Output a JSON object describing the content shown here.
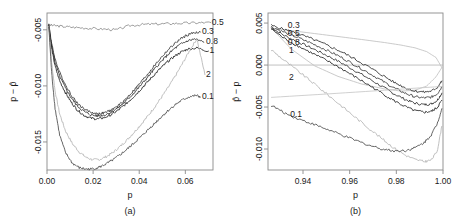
{
  "figure": {
    "background": "#ffffff",
    "frame_color": "#8a8a8a"
  },
  "chart_data": [
    {
      "type": "line",
      "panel": "a",
      "panel_label": "(a)",
      "title": "",
      "xlabel": "p",
      "ylabel": "p − p̂",
      "xlim": [
        0.0,
        0.072
      ],
      "ylim": [
        -0.0175,
        -0.0035
      ],
      "xticks": [
        0.0,
        0.02,
        0.04,
        0.06
      ],
      "xtick_labels": [
        "0.00",
        "0.02",
        "0.04",
        "0.06"
      ],
      "yticks": [
        -0.005,
        -0.01,
        -0.015
      ],
      "ytick_labels": [
        "-0.005",
        "-0.010",
        "-0.015"
      ],
      "grid": false,
      "legend": "inline-curve-labels-right",
      "series": [
        {
          "name": "0.5",
          "label": "0.5",
          "color": "#8c8c8c",
          "label_x": 0.0715,
          "label_y": -0.00435,
          "x": [
            0.0005,
            0.003,
            0.007,
            0.012,
            0.018,
            0.024,
            0.03,
            0.036,
            0.042,
            0.048,
            0.054,
            0.06,
            0.066,
            0.071
          ],
          "y": [
            -0.00455,
            -0.00462,
            -0.0047,
            -0.00478,
            -0.00486,
            -0.00493,
            -0.005,
            -0.00462,
            -0.00452,
            -0.00448,
            -0.00444,
            -0.0044,
            -0.00437,
            -0.00435
          ]
        },
        {
          "name": "0.3",
          "label": "0.3",
          "color": "#3a3a3a",
          "label_x": 0.0672,
          "label_y": -0.0052,
          "x": [
            0.0008,
            0.002,
            0.0035,
            0.0055,
            0.008,
            0.0105,
            0.013,
            0.016,
            0.019,
            0.022,
            0.025,
            0.028,
            0.031,
            0.034,
            0.037,
            0.04,
            0.043,
            0.046,
            0.049,
            0.052,
            0.055,
            0.058,
            0.061,
            0.064,
            0.0665
          ],
          "y": [
            -0.00455,
            -0.0062,
            -0.0076,
            -0.0088,
            -0.0099,
            -0.0108,
            -0.0115,
            -0.01205,
            -0.01235,
            -0.0125,
            -0.0124,
            -0.01215,
            -0.01175,
            -0.0112,
            -0.01055,
            -0.00985,
            -0.0091,
            -0.00835,
            -0.0076,
            -0.0069,
            -0.0063,
            -0.0058,
            -0.00545,
            -0.00525,
            -0.0052
          ]
        },
        {
          "name": "0.8",
          "label": "0.8",
          "color": "#2a2a2a",
          "label_x": 0.069,
          "label_y": -0.0061,
          "x": [
            0.0008,
            0.002,
            0.0035,
            0.0055,
            0.008,
            0.0105,
            0.013,
            0.016,
            0.019,
            0.022,
            0.025,
            0.028,
            0.031,
            0.034,
            0.037,
            0.04,
            0.043,
            0.046,
            0.049,
            0.052,
            0.055,
            0.058,
            0.061,
            0.064,
            0.068
          ],
          "y": [
            -0.0046,
            -0.0064,
            -0.0079,
            -0.00915,
            -0.0102,
            -0.01105,
            -0.01175,
            -0.01228,
            -0.01258,
            -0.01268,
            -0.01258,
            -0.01232,
            -0.01192,
            -0.0114,
            -0.01078,
            -0.0101,
            -0.00938,
            -0.00865,
            -0.00795,
            -0.0073,
            -0.00672,
            -0.00628,
            -0.00598,
            -0.00582,
            -0.0061
          ]
        },
        {
          "name": "1",
          "label": "1",
          "color": "#1f1f1f",
          "label_x": 0.0705,
          "label_y": -0.0069,
          "x": [
            0.0008,
            0.002,
            0.0035,
            0.0055,
            0.008,
            0.0105,
            0.013,
            0.016,
            0.019,
            0.022,
            0.025,
            0.028,
            0.031,
            0.034,
            0.037,
            0.04,
            0.043,
            0.046,
            0.049,
            0.052,
            0.055,
            0.058,
            0.061,
            0.065,
            0.07
          ],
          "y": [
            -0.00465,
            -0.00665,
            -0.00825,
            -0.00955,
            -0.0106,
            -0.01145,
            -0.01212,
            -0.01262,
            -0.01288,
            -0.01295,
            -0.01282,
            -0.01255,
            -0.01215,
            -0.01165,
            -0.01108,
            -0.01045,
            -0.00978,
            -0.00912,
            -0.00848,
            -0.0079,
            -0.0074,
            -0.007,
            -0.00672,
            -0.00662,
            -0.0069
          ]
        },
        {
          "name": "2",
          "label": "2",
          "color": "#b5b5b5",
          "label_x": 0.069,
          "label_y": -0.009,
          "x": [
            0.0008,
            0.002,
            0.0035,
            0.0055,
            0.008,
            0.011,
            0.014,
            0.017,
            0.02,
            0.023,
            0.026,
            0.029,
            0.032,
            0.035,
            0.038,
            0.041,
            0.044,
            0.047,
            0.05,
            0.053,
            0.056,
            0.059,
            0.062,
            0.065,
            0.0685
          ],
          "y": [
            -0.0047,
            -0.0079,
            -0.01045,
            -0.0125,
            -0.014,
            -0.01515,
            -0.0159,
            -0.01638,
            -0.0166,
            -0.01655,
            -0.01628,
            -0.01588,
            -0.01535,
            -0.01475,
            -0.01408,
            -0.01338,
            -0.01262,
            -0.0118,
            -0.01092,
            -0.01,
            -0.009,
            -0.00792,
            -0.0068,
            -0.0058,
            -0.009
          ]
        },
        {
          "name": "0.1",
          "label": "0.1",
          "color": "#4a4a4a",
          "label_x": 0.0672,
          "label_y": -0.011,
          "x": [
            0.0008,
            0.002,
            0.0035,
            0.0055,
            0.008,
            0.011,
            0.014,
            0.017,
            0.02,
            0.023,
            0.026,
            0.029,
            0.032,
            0.035,
            0.038,
            0.041,
            0.044,
            0.047,
            0.05,
            0.053,
            0.056,
            0.059,
            0.062,
            0.065,
            0.0665
          ],
          "y": [
            -0.00475,
            -0.0088,
            -0.012,
            -0.0144,
            -0.01595,
            -0.0169,
            -0.0173,
            -0.01742,
            -0.0174,
            -0.01722,
            -0.01692,
            -0.01655,
            -0.0161,
            -0.0156,
            -0.01505,
            -0.01448,
            -0.01388,
            -0.01328,
            -0.01268,
            -0.01212,
            -0.01162,
            -0.01122,
            -0.01095,
            -0.01085,
            -0.011
          ]
        }
      ]
    },
    {
      "type": "line",
      "panel": "b",
      "panel_label": "(b)",
      "title": "",
      "xlabel": "p",
      "ylabel": "p̂ − p",
      "xlim": [
        0.925,
        1.0
      ],
      "ylim": [
        -0.0125,
        0.0062
      ],
      "xticks": [
        0.94,
        0.96,
        0.98,
        1.0
      ],
      "xtick_labels": [
        "0.94",
        "0.96",
        "0.98",
        "1.00"
      ],
      "yticks": [
        0.005,
        0.0,
        -0.005,
        -0.01
      ],
      "ytick_labels": [
        "0.005",
        "0.000",
        "-0.005",
        "-0.010"
      ],
      "grid": false,
      "zero_line": 0.0,
      "legend": "inline-curve-labels-left",
      "series": [
        {
          "name": "0.5-envelope",
          "label": "",
          "color": "#c0c0c0",
          "label_x": null,
          "label_y": null,
          "x": [
            0.9265,
            0.935,
            0.945,
            0.955,
            0.965,
            0.975,
            0.982,
            0.988,
            0.993,
            0.997,
            0.9995
          ],
          "y": [
            0.0044,
            0.0041,
            0.00375,
            0.0034,
            0.00305,
            0.00268,
            0.00238,
            0.00205,
            0.0016,
            0.0009,
            -0.0003
          ]
        },
        {
          "name": "0.5-envelope-lower",
          "label": "",
          "color": "#c0c0c0",
          "label_x": null,
          "label_y": null,
          "x": [
            0.9265,
            0.935,
            0.945,
            0.955,
            0.965,
            0.975,
            0.982,
            0.988,
            0.993,
            0.997,
            0.9995
          ],
          "y": [
            0.0044,
            0.0019,
            -0.0001,
            -0.00135,
            -0.00225,
            -0.00285,
            -0.0031,
            -0.003,
            -0.0025,
            -0.0014,
            -0.0003
          ]
        },
        {
          "name": "0.3",
          "label": "0.3",
          "color": "#2a2a2a",
          "label_x": 0.9335,
          "label_y": 0.00465,
          "x": [
            0.9265,
            0.932,
            0.938,
            0.944,
            0.95,
            0.956,
            0.962,
            0.968,
            0.974,
            0.979,
            0.984,
            0.988,
            0.992,
            0.995,
            0.9975,
            0.9995
          ],
          "y": [
            0.0047,
            0.00425,
            0.0037,
            0.0031,
            0.0024,
            0.00165,
            0.00075,
            -0.0002,
            -0.0012,
            -0.00205,
            -0.00272,
            -0.0031,
            -0.00322,
            -0.0031,
            -0.00268,
            -0.0019
          ]
        },
        {
          "name": "0.5",
          "label": "0.5",
          "color": "#3a3a3a",
          "label_x": 0.9335,
          "label_y": 0.0037,
          "x": [
            0.9265,
            0.932,
            0.938,
            0.944,
            0.95,
            0.956,
            0.962,
            0.968,
            0.974,
            0.979,
            0.984,
            0.988,
            0.992,
            0.995,
            0.9975,
            0.9995
          ],
          "y": [
            0.00455,
            0.0039,
            0.00325,
            0.00255,
            0.0018,
            0.00098,
            5e-05,
            -0.0009,
            -0.0019,
            -0.00272,
            -0.00338,
            -0.00378,
            -0.00392,
            -0.00382,
            -0.00342,
            -0.00262
          ]
        },
        {
          "name": "0.8",
          "label": "0.8",
          "color": "#2f2f2f",
          "label_x": 0.9335,
          "label_y": 0.00262,
          "x": [
            0.9265,
            0.932,
            0.938,
            0.944,
            0.95,
            0.956,
            0.962,
            0.968,
            0.974,
            0.979,
            0.984,
            0.988,
            0.992,
            0.995,
            0.9975,
            0.9995
          ],
          "y": [
            0.00442,
            0.00352,
            0.00275,
            0.00198,
            0.00118,
            0.00032,
            -0.00062,
            -0.00158,
            -0.00258,
            -0.00342,
            -0.00412,
            -0.00455,
            -0.00472,
            -0.00462,
            -0.0042,
            -0.00335
          ]
        },
        {
          "name": "1",
          "label": "1",
          "color": "#1f1f1f",
          "label_x": 0.934,
          "label_y": 0.00175,
          "x": [
            0.9265,
            0.932,
            0.938,
            0.944,
            0.95,
            0.956,
            0.962,
            0.968,
            0.974,
            0.979,
            0.984,
            0.988,
            0.992,
            0.995,
            0.9975,
            0.9995
          ],
          "y": [
            0.0043,
            0.00315,
            0.00225,
            0.0014,
            0.00055,
            -0.00035,
            -0.00135,
            -0.00235,
            -0.00338,
            -0.00425,
            -0.00498,
            -0.00545,
            -0.00562,
            -0.00552,
            -0.00508,
            -0.0042
          ]
        },
        {
          "name": "2",
          "label": "2",
          "color": "#b5b5b5",
          "label_x": 0.934,
          "label_y": -0.00148,
          "x": [
            0.9265,
            0.932,
            0.938,
            0.944,
            0.95,
            0.956,
            0.962,
            0.968,
            0.974,
            0.979,
            0.984,
            0.988,
            0.992,
            0.995,
            0.9975,
            0.9995
          ],
          "y": [
            0.0018,
            0.00055,
            -0.00075,
            -0.00205,
            -0.0034,
            -0.00475,
            -0.00612,
            -0.00748,
            -0.0088,
            -0.00988,
            -0.01075,
            -0.01125,
            -0.0115,
            -0.0113,
            -0.01025,
            -0.0073
          ]
        },
        {
          "name": "0.1",
          "label": "0.1",
          "color": "#4a4a4a",
          "label_x": 0.9345,
          "label_y": -0.00595,
          "x": [
            0.9265,
            0.932,
            0.938,
            0.944,
            0.95,
            0.956,
            0.962,
            0.968,
            0.974,
            0.979,
            0.984,
            0.988,
            0.992,
            0.995,
            0.9975,
            0.9995
          ],
          "y": [
            -0.0048,
            -0.0057,
            -0.0064,
            -0.007,
            -0.00762,
            -0.00828,
            -0.00892,
            -0.00952,
            -0.01,
            -0.01022,
            -0.01018,
            -0.00985,
            -0.00922,
            -0.0083,
            -0.007,
            -0.0052
          ]
        },
        {
          "name": "0.1-trend",
          "label": "",
          "color": "#c8c8c8",
          "label_x": null,
          "label_y": null,
          "x": [
            0.9265,
            0.95,
            0.975,
            0.99,
            0.9995
          ],
          "y": [
            -0.00385,
            -0.00345,
            -0.003,
            -0.00272,
            -0.00255
          ]
        }
      ]
    }
  ]
}
